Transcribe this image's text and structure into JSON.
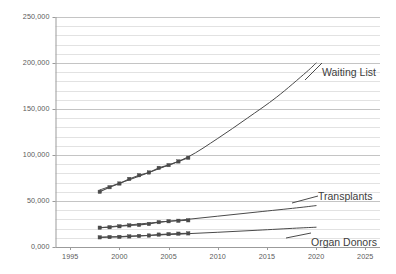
{
  "chart_data": {
    "type": "line",
    "title": "",
    "xlabel": "",
    "ylabel": "",
    "xlim": [
      1993.5,
      2026.5
    ],
    "ylim": [
      0,
      250000
    ],
    "grid": true,
    "grid_minor_step": 10000,
    "grid_major_step": 50000,
    "legend_position": "inline-right-of-lines",
    "y_ticks": [
      {
        "value": 250000,
        "label": "250,000"
      },
      {
        "value": 200000,
        "label": "200,000"
      },
      {
        "value": 150000,
        "label": "150,000"
      },
      {
        "value": 100000,
        "label": "100,000"
      },
      {
        "value": 50000,
        "label": "50,000"
      },
      {
        "value": 0,
        "label": "0,000"
      }
    ],
    "x_ticks": [
      {
        "value": 1995,
        "label": "1995"
      },
      {
        "value": 2000,
        "label": "2000"
      },
      {
        "value": 2005,
        "label": "2005"
      },
      {
        "value": 2010,
        "label": "2010"
      },
      {
        "value": 2015,
        "label": "2015"
      },
      {
        "value": 2020,
        "label": "2020"
      },
      {
        "value": 2025,
        "label": "2025"
      }
    ],
    "series": [
      {
        "name": "Waiting List",
        "label": "Waiting List",
        "color": "#4a4a4a",
        "marker": "square",
        "observed_x": [
          1998,
          1999,
          2000,
          2001,
          2002,
          2003,
          2004,
          2005,
          2006,
          2007
        ],
        "observed_values": [
          60000,
          65000,
          69000,
          74000,
          78000,
          81000,
          86000,
          89000,
          93000,
          97000
        ],
        "projection_x": [
          1998,
          2001,
          2004,
          2007,
          2010,
          2013,
          2016,
          2019,
          2020
        ],
        "projection_values": [
          62000,
          73000,
          85000,
          98000,
          118000,
          140000,
          163000,
          190000,
          200000
        ]
      },
      {
        "name": "Transplants",
        "label": "Transplants",
        "color": "#4a4a4a",
        "marker": "square",
        "observed_x": [
          1998,
          1999,
          2000,
          2001,
          2002,
          2003,
          2004,
          2005,
          2006,
          2007
        ],
        "observed_values": [
          21000,
          21500,
          22500,
          23500,
          24000,
          25000,
          27000,
          28000,
          28500,
          29000
        ],
        "projection_x": [
          1998,
          2002,
          2006,
          2010,
          2014,
          2018,
          2020
        ],
        "projection_values": [
          21000,
          25000,
          29000,
          33500,
          38000,
          42500,
          45000
        ]
      },
      {
        "name": "Organ Donors",
        "label": "Organ Donors",
        "color": "#4a4a4a",
        "marker": "square",
        "observed_x": [
          1998,
          1999,
          2000,
          2001,
          2002,
          2003,
          2004,
          2005,
          2006,
          2007
        ],
        "observed_values": [
          10500,
          10800,
          11000,
          11500,
          12000,
          12500,
          13500,
          14000,
          14500,
          14800
        ],
        "projection_x": [
          1998,
          2002,
          2006,
          2010,
          2014,
          2018,
          2020
        ],
        "projection_values": [
          10500,
          12200,
          14000,
          16000,
          18200,
          20500,
          21500
        ]
      }
    ],
    "series_labels": [
      {
        "text": "Waiting List",
        "x_px": 322,
        "y_px": 72
      },
      {
        "text": "Transplants",
        "x_px": 318,
        "y_px": 196
      },
      {
        "text": "Organ Donors",
        "x_px": 311,
        "y_px": 242
      }
    ],
    "colors": {
      "line": "#4a4a4a",
      "axis": "#9b9b9b",
      "grid_minor": "#e2e2e2",
      "grid_major": "#c4c4c4",
      "tick_text": "#5a5a5a",
      "label_text": "#3d3d3d",
      "background": "#ffffff"
    }
  }
}
